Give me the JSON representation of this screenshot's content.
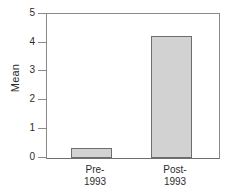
{
  "chart_data": {
    "type": "bar",
    "title": "",
    "xlabel": "",
    "ylabel": "Mean",
    "categories": [
      "Pre-1993",
      "Post-1993"
    ],
    "category_lines": [
      [
        "Pre-",
        "1993"
      ],
      [
        "Post-",
        "1993"
      ]
    ],
    "values": [
      0.35,
      4.22
    ],
    "ylim": [
      0,
      5
    ],
    "yticks": [
      0,
      1,
      2,
      3,
      4,
      5
    ],
    "ytick_labels": [
      "0",
      "1",
      "2",
      "3",
      "4",
      "5"
    ],
    "grid": false,
    "legend": null,
    "bar_fill_color": "#d2d2d2",
    "bar_edge_color": "#6e6e6e",
    "axis_color": "#8a8a8a",
    "text_color": "#2b2b2b",
    "background_color": "#ffffff"
  },
  "axis": {
    "y_title": "Mean",
    "tick_0": "0",
    "tick_1": "1",
    "tick_2": "2",
    "tick_3": "3",
    "tick_4": "4",
    "tick_5": "5"
  },
  "xaxis": {
    "cat0_line1": "Pre-",
    "cat0_line2": "1993",
    "cat1_line1": "Post-",
    "cat1_line2": "1993"
  }
}
